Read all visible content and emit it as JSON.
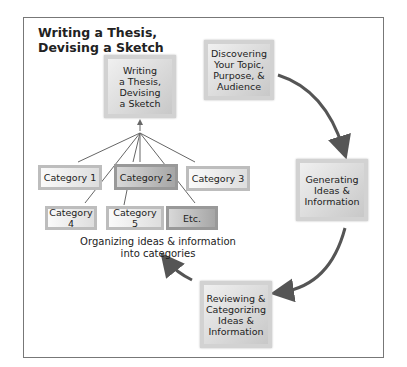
{
  "title": [
    "Writing a Thesis,",
    "Devising a Sketch"
  ],
  "process_boxes": {
    "writing": [
      "Writing",
      "a Thesis,",
      "Devising",
      "a Sketch"
    ],
    "discovering": [
      "Discovering",
      "Your Topic,",
      "Purpose, &",
      "Audience"
    ],
    "generating": [
      "Generating",
      "Ideas &",
      "Information"
    ],
    "reviewing": [
      "Reviewing &",
      "Categorizing",
      "Ideas &",
      "Information"
    ]
  },
  "categories": [
    "Category 1",
    "Category 2",
    "Category 3",
    "Category 4",
    "Category 5",
    "Etc."
  ],
  "caption": [
    "Organizing ideas & information",
    "into categories"
  ],
  "colors": {
    "frame": "#777777",
    "arrow": "#555555",
    "box_light": "#f0f0f0",
    "box_dark": "#a6a6a6"
  }
}
